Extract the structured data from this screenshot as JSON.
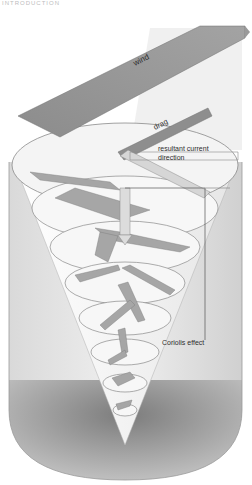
{
  "page": {
    "header_fragment": "INTRODUCTION"
  },
  "diagram": {
    "labels": {
      "wind": "wind",
      "drag": "drag",
      "resultant_line1": "resultant current",
      "resultant_line2": "direction",
      "coriolis": "Coriolis effect"
    },
    "colors": {
      "background": "#ffffff",
      "cylinder_side": "#cfcfcf",
      "cylinder_bottom": "#a9a9a9",
      "disc_fill": "#f3f3f3",
      "disc_edge": "#8a8a8a",
      "arrow_fill": "#9c9c9c",
      "wind_band": "#8f8f8f",
      "label_text": "#2e2e2e"
    },
    "layers": 8
  }
}
